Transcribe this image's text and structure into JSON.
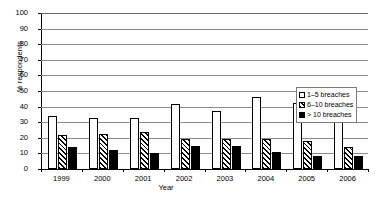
{
  "chart_data": {
    "type": "bar",
    "title": "",
    "xlabel": "Year",
    "ylabel": "% respondents",
    "categories": [
      "1999",
      "2000",
      "2001",
      "2002",
      "2003",
      "2004",
      "2005",
      "2006"
    ],
    "series": [
      {
        "name": "1–5 breaches",
        "values": [
          34,
          33,
          32.5,
          41.5,
          37.5,
          46,
          42,
          47
        ]
      },
      {
        "name": "6–10 breaches",
        "values": [
          22,
          22.5,
          23.5,
          19.5,
          19.5,
          19,
          18,
          14
        ]
      },
      {
        "name": "> 10 breaches",
        "values": [
          14,
          12.5,
          10.5,
          14.5,
          15,
          11,
          8.5,
          8.5
        ]
      }
    ],
    "ylim": [
      0,
      100
    ],
    "ytick_values": [
      0,
      10,
      20,
      30,
      40,
      50,
      60,
      70,
      80,
      90,
      100
    ],
    "ytick_labels": [
      "0",
      "10",
      "20",
      "30",
      "40",
      "50",
      "60",
      "70",
      "80",
      "90",
      "100"
    ],
    "grid": true,
    "legend_position": "right-middle",
    "legend": [
      "1–5 breaches",
      "6–10 breaches",
      "> 10 breaches"
    ],
    "colors": {
      "series1": "#ffffff",
      "series2": "#ffffff",
      "series3": "#000000",
      "outline": "#000000",
      "gridline": "#8c8c8c",
      "background": "#ffffff"
    }
  }
}
